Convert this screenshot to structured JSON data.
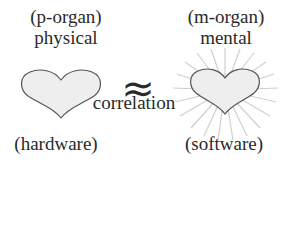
{
  "left": {
    "organ_label": "(p-organ)",
    "type_label": "physical",
    "bottom_label": "(hardware)",
    "icon": "heart-icon"
  },
  "right": {
    "organ_label": "(m-organ)",
    "type_label": "mental",
    "bottom_label": "(software)",
    "icon": "radiant-heart-icon"
  },
  "relation": {
    "symbol": "≈",
    "label": "correlation"
  },
  "colors": {
    "text": "#2a2a2a",
    "heart_fill": "#eeeeee",
    "heart_stroke": "#555555",
    "rays": "#d0d0d0"
  }
}
